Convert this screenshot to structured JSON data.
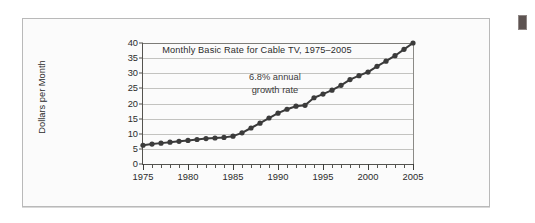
{
  "figure": {
    "panel_background": "#fbfbfb",
    "border_color": "#b9b9b9",
    "marker_chip_color": "#5d5351"
  },
  "chart_data": {
    "type": "line",
    "title": "Monthly Basic Rate for Cable TV, 1975–2005",
    "xlabel": "",
    "ylabel": "Dollars per Month",
    "xlim": [
      1975,
      2005
    ],
    "ylim": [
      0,
      40
    ],
    "grid": true,
    "legend": "none",
    "series_color": "#3b3b3b",
    "marker": "filled-circle",
    "annotations": [
      {
        "text_line1": "6.8% annual",
        "text_line2": "growth rate",
        "x": 1990,
        "y": 26
      }
    ],
    "y_ticks": [
      0,
      5,
      10,
      15,
      20,
      25,
      30,
      35,
      40
    ],
    "x_ticks_major": [
      1975,
      1980,
      1985,
      1990,
      1995,
      2000,
      2005
    ],
    "x_ticks_minor_step": 1,
    "x": [
      1975,
      1976,
      1977,
      1978,
      1979,
      1980,
      1981,
      1982,
      1983,
      1984,
      1985,
      1986,
      1987,
      1988,
      1989,
      1990,
      1991,
      1992,
      1993,
      1994,
      1995,
      1996,
      1997,
      1998,
      1999,
      2000,
      2001,
      2002,
      2003,
      2004,
      2005
    ],
    "values": [
      6.2,
      6.6,
      6.9,
      7.2,
      7.5,
      7.8,
      8.1,
      8.4,
      8.6,
      8.8,
      9.2,
      10.3,
      11.9,
      13.5,
      15.2,
      16.8,
      18.1,
      19.1,
      19.4,
      21.9,
      23.1,
      24.4,
      26.0,
      27.9,
      29.2,
      30.4,
      32.3,
      34.0,
      35.8,
      37.9,
      40.0
    ],
    "units": "dollars per month"
  }
}
